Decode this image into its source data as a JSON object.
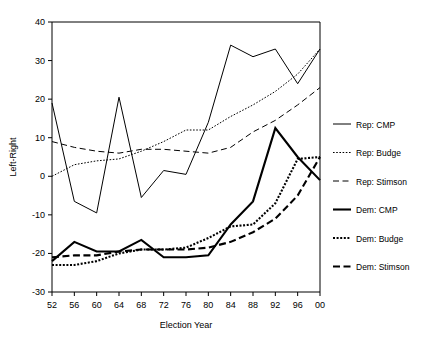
{
  "chart_data": {
    "type": "line",
    "title": "",
    "xlabel": "Election Year",
    "ylabel": "Left-Right",
    "xlim": [
      52,
      100
    ],
    "ylim": [
      -30,
      40
    ],
    "grid": false,
    "legend_position": "right",
    "x": [
      "52",
      "56",
      "60",
      "64",
      "68",
      "72",
      "76",
      "80",
      "84",
      "88",
      "92",
      "96",
      "00"
    ],
    "x_values": [
      52,
      56,
      60,
      64,
      68,
      72,
      76,
      80,
      84,
      88,
      92,
      96,
      100
    ],
    "xticks": [
      "52",
      "56",
      "60",
      "64",
      "68",
      "72",
      "76",
      "80",
      "84",
      "88",
      "92",
      "96",
      "00"
    ],
    "yticks": [
      "-30",
      "-20",
      "-10",
      "0",
      "10",
      "20",
      "30",
      "40"
    ],
    "ytick_values": [
      -30,
      -20,
      -10,
      0,
      10,
      20,
      30,
      40
    ],
    "series": [
      {
        "name": "Rep: CMP",
        "style": "solid",
        "weight": "thin",
        "color": "#000000",
        "values": [
          19,
          -6.5,
          -9.5,
          20.5,
          -5.5,
          1.5,
          0.5,
          14,
          34,
          31,
          33,
          24,
          33
        ]
      },
      {
        "name": "Rep: Budge",
        "style": "dotted",
        "weight": "thin",
        "color": "#000000",
        "values": [
          0,
          3,
          4,
          4.5,
          6.5,
          9,
          12,
          12,
          15.5,
          18.5,
          22,
          26.5,
          33
        ]
      },
      {
        "name": "Rep: Stimson",
        "style": "dashed",
        "weight": "thin",
        "color": "#000000",
        "values": [
          9,
          7.5,
          6.5,
          6,
          7,
          7,
          6.5,
          6,
          7.5,
          11.5,
          14.5,
          18.5,
          23
        ]
      },
      {
        "name": "Dem: CMP",
        "style": "solid",
        "weight": "thick",
        "color": "#000000",
        "values": [
          -22,
          -17,
          -19.5,
          -19.5,
          -16.5,
          -21,
          -21,
          -20.5,
          -12.5,
          -6.5,
          12.5,
          5,
          -1
        ]
      },
      {
        "name": "Dem: Budge",
        "style": "dotted",
        "weight": "thick",
        "color": "#000000",
        "values": [
          -23,
          -23,
          -22,
          -20,
          -19,
          -19,
          -18.5,
          -16,
          -13,
          -12.5,
          -7,
          4.5,
          5
        ]
      },
      {
        "name": "Dem: Stimson",
        "style": "dashed",
        "weight": "thick",
        "color": "#000000",
        "values": [
          -21,
          -20.5,
          -20.5,
          -19.5,
          -19,
          -19,
          -19,
          -18.5,
          -17,
          -14.5,
          -11,
          -5,
          5
        ]
      }
    ],
    "legend": [
      {
        "label": "Rep: CMP",
        "style": "solid",
        "weight": "thin"
      },
      {
        "label": "Rep: Budge",
        "style": "dotted",
        "weight": "thin"
      },
      {
        "label": "Rep: Stimson",
        "style": "dashed",
        "weight": "thin"
      },
      {
        "label": "Dem: CMP",
        "style": "solid",
        "weight": "thick"
      },
      {
        "label": "Dem: Budge",
        "style": "dotted",
        "weight": "thick"
      },
      {
        "label": "Dem: Stimson",
        "style": "dashed",
        "weight": "thick"
      }
    ]
  }
}
